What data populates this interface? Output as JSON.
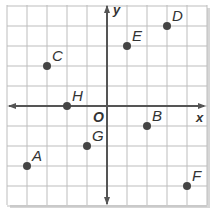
{
  "diagram": {
    "type": "coordinate-plane",
    "x_axis_label": "x",
    "y_axis_label": "y",
    "origin_label": "O",
    "x_range": [
      -5,
      5
    ],
    "y_range": [
      -5,
      5
    ],
    "colors": {
      "grid": "#bdbdbd",
      "axis": "#555555",
      "point": "#444444",
      "label": "#333333",
      "background": "#ffffff",
      "shadow": "#cfcfcf"
    },
    "points": [
      {
        "label": "A",
        "x": -4,
        "y": -3
      },
      {
        "label": "B",
        "x": 2,
        "y": -1
      },
      {
        "label": "C",
        "x": -3,
        "y": 2
      },
      {
        "label": "D",
        "x": 3,
        "y": 4
      },
      {
        "label": "E",
        "x": 1,
        "y": 3
      },
      {
        "label": "F",
        "x": 4,
        "y": -4
      },
      {
        "label": "G",
        "x": -1,
        "y": -2
      },
      {
        "label": "H",
        "x": -2,
        "y": 0
      }
    ]
  }
}
